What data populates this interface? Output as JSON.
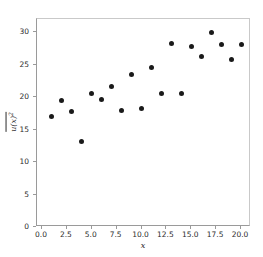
{
  "figure": {
    "background_color": "#ffffff",
    "marker_color": "#1a1a1a",
    "axis_color": "#9a9a9a"
  },
  "axis": {
    "xlabel": "x",
    "ylabel_base": "u(x)",
    "ylabel_exponent": "2",
    "xticks": [
      "0.0",
      "2.5",
      "5.0",
      "7.5",
      "10.0",
      "12.5",
      "15.0",
      "17.5",
      "20.0"
    ],
    "xtick_values": [
      0.0,
      2.5,
      5.0,
      7.5,
      10.0,
      12.5,
      15.0,
      17.5,
      20.0
    ],
    "yticks": [
      "0",
      "5",
      "10",
      "15",
      "20",
      "25",
      "30"
    ],
    "ytick_values": [
      0,
      5,
      10,
      15,
      20,
      25,
      30
    ]
  },
  "chart_data": {
    "type": "scatter",
    "title": "",
    "xlabel": "x",
    "ylabel": "u(x)^2 (overline / time-averaged)",
    "xlim": [
      -0.5,
      21.0
    ],
    "ylim": [
      0,
      32.0
    ],
    "grid": false,
    "legend": null,
    "marker": "circle",
    "marker_color": "#1a1a1a",
    "x": [
      1,
      2,
      3,
      4,
      5,
      6,
      7,
      8,
      9,
      10,
      11,
      12,
      13,
      14,
      15,
      16,
      17,
      18,
      19,
      20
    ],
    "y": [
      17.0,
      19.4,
      17.7,
      13.2,
      20.5,
      19.6,
      21.6,
      17.9,
      23.5,
      18.2,
      24.5,
      20.5,
      28.2,
      20.6,
      27.8,
      26.2,
      29.9,
      28.1,
      25.8,
      28.1
    ],
    "points": [
      {
        "x": 1,
        "y": 17.0
      },
      {
        "x": 2,
        "y": 19.4
      },
      {
        "x": 3,
        "y": 17.7
      },
      {
        "x": 4,
        "y": 13.2
      },
      {
        "x": 5,
        "y": 20.5
      },
      {
        "x": 6,
        "y": 19.6
      },
      {
        "x": 7,
        "y": 21.6
      },
      {
        "x": 8,
        "y": 17.9
      },
      {
        "x": 9,
        "y": 23.5
      },
      {
        "x": 10,
        "y": 18.2
      },
      {
        "x": 11,
        "y": 24.5
      },
      {
        "x": 12,
        "y": 20.5
      },
      {
        "x": 13,
        "y": 28.2
      },
      {
        "x": 14,
        "y": 20.6
      },
      {
        "x": 15,
        "y": 27.8
      },
      {
        "x": 16,
        "y": 26.2
      },
      {
        "x": 17,
        "y": 29.9
      },
      {
        "x": 18,
        "y": 28.1
      },
      {
        "x": 19,
        "y": 25.8
      },
      {
        "x": 20,
        "y": 28.1
      }
    ]
  }
}
